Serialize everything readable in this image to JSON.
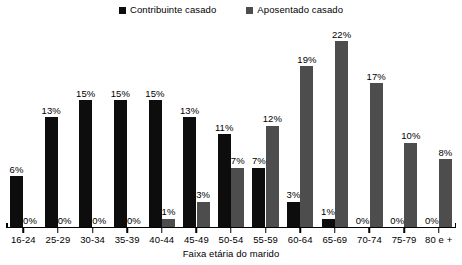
{
  "chart_data": {
    "type": "bar",
    "title": "",
    "xlabel": "Faixa etária do marido",
    "ylabel": "",
    "ylim": [
      0,
      24
    ],
    "grid": false,
    "legend_position": "top-center",
    "value_label_suffix": "%",
    "categories": [
      "16-24",
      "25-29",
      "30-34",
      "35-39",
      "40-44",
      "45-49",
      "50-54",
      "55-59",
      "60-64",
      "65-69",
      "70-74",
      "75-79",
      "80 e +"
    ],
    "series": [
      {
        "name": "Contribuinte casado",
        "color": "#0d0d0d",
        "values": [
          6,
          13,
          15,
          15,
          15,
          13,
          11,
          7,
          3,
          1,
          0,
          0,
          0
        ],
        "labels": [
          "6%",
          "13%",
          "15%",
          "15%",
          "15%",
          "13%",
          "11%",
          "7%",
          "3%",
          "1%",
          "0%",
          "0%",
          "0%"
        ]
      },
      {
        "name": "Aposentado casado",
        "color": "#4d4d4d",
        "values": [
          0,
          0,
          0,
          0,
          1,
          3,
          7,
          12,
          19,
          22,
          17,
          10,
          8
        ],
        "labels": [
          "0%",
          "0%",
          "0%",
          "0%",
          "1%",
          "3%",
          "7%",
          "12%",
          "19%",
          "22%",
          "17%",
          "10%",
          "8%"
        ]
      }
    ]
  },
  "legend": {
    "entries": [
      {
        "label": "Contribuinte casado",
        "marker": "square-marker",
        "color": "#0d0d0d"
      },
      {
        "label": "Aposentado casado",
        "marker": "square-marker",
        "color": "#4d4d4d"
      }
    ]
  }
}
